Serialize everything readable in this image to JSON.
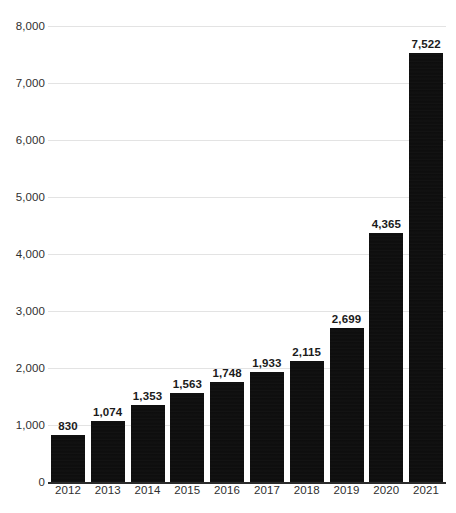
{
  "chart_data": {
    "type": "bar",
    "title": "",
    "subtitle": "",
    "xlabel": "",
    "ylabel": "",
    "categories": [
      "2012",
      "2013",
      "2014",
      "2015",
      "2016",
      "2017",
      "2018",
      "2019",
      "2020",
      "2021"
    ],
    "values": [
      830,
      1074,
      1353,
      1563,
      1748,
      1933,
      2115,
      2699,
      4365,
      7522
    ],
    "value_labels": [
      "830",
      "1,074",
      "1,353",
      "1,563",
      "1,748",
      "1,933",
      "2,115",
      "2,699",
      "4,365",
      "7,522"
    ],
    "ylim": [
      0,
      8000
    ],
    "ytick_values": [
      0,
      1000,
      2000,
      3000,
      4000,
      5000,
      6000,
      7000,
      8000
    ],
    "ytick_labels": [
      "0",
      "1,000",
      "2,000",
      "3,000",
      "4,000",
      "5,000",
      "6,000",
      "7,000",
      "8,000"
    ],
    "grid": true,
    "legend": false,
    "legend_position": "none",
    "series": [
      {
        "name": "",
        "values": [
          830,
          1074,
          1353,
          1563,
          1748,
          1933,
          2115,
          2699,
          4365,
          7522
        ]
      }
    ],
    "bar_color": "#0d0d0d",
    "grid_color": "#e3e3e3",
    "axis_color": "#2b2b2b",
    "text_color": "#2f2f2f"
  },
  "caption": {
    "text": ""
  }
}
